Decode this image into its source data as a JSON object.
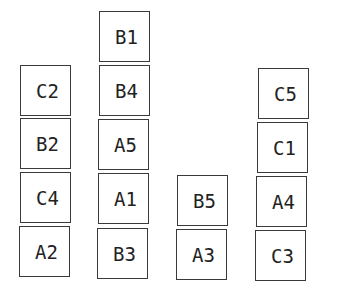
{
  "diagram": {
    "type": "blocks-world stacks",
    "stacks": [
      {
        "id": "stack-1",
        "blocks_top_to_bottom": [
          "C2",
          "B2",
          "C4",
          "A2"
        ]
      },
      {
        "id": "stack-2",
        "blocks_top_to_bottom": [
          "B1",
          "B4",
          "A5",
          "A1",
          "B3"
        ]
      },
      {
        "id": "stack-3",
        "blocks_top_to_bottom": [
          "B5",
          "A3"
        ]
      },
      {
        "id": "stack-4",
        "blocks_top_to_bottom": [
          "C5",
          "C1",
          "A4",
          "C3"
        ]
      }
    ]
  },
  "blocks": [
    {
      "label": "C2",
      "x": 20,
      "y": 65
    },
    {
      "label": "B2",
      "x": 20,
      "y": 118
    },
    {
      "label": "C4",
      "x": 20,
      "y": 172
    },
    {
      "label": "A2",
      "x": 19,
      "y": 226
    },
    {
      "label": "B1",
      "x": 99,
      "y": 11
    },
    {
      "label": "B4",
      "x": 99,
      "y": 65
    },
    {
      "label": "A5",
      "x": 98,
      "y": 119
    },
    {
      "label": "A1",
      "x": 98,
      "y": 173
    },
    {
      "label": "B3",
      "x": 97,
      "y": 228
    },
    {
      "label": "B5",
      "x": 177,
      "y": 175
    },
    {
      "label": "A3",
      "x": 176,
      "y": 229
    },
    {
      "label": "C5",
      "x": 258,
      "y": 68
    },
    {
      "label": "C1",
      "x": 257,
      "y": 122
    },
    {
      "label": "A4",
      "x": 256,
      "y": 176
    },
    {
      "label": "C3",
      "x": 255,
      "y": 230
    }
  ]
}
